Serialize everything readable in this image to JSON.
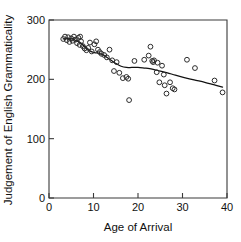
{
  "figure": {
    "width": 241,
    "height": 242,
    "background": "#ffffff",
    "foreground": "#111111"
  },
  "axis_titles": {
    "x": "Age of Arrival",
    "y": "Judgement of English Grammaticality"
  },
  "ticks": {
    "x_labels": [
      "0",
      "10",
      "20",
      "30",
      "40"
    ],
    "y_labels": [
      "0",
      "100",
      "200",
      "300"
    ]
  },
  "chart_data": {
    "type": "scatter",
    "title": "",
    "subtitle": "",
    "xlabel": "Age of Arrival",
    "ylabel": "Judgement of English Grammaticality",
    "xlim": [
      0,
      40
    ],
    "ylim": [
      0,
      300
    ],
    "xticks": [
      0,
      10,
      20,
      30,
      40
    ],
    "yticks": [
      0,
      100,
      200,
      300
    ],
    "grid": false,
    "legend": null,
    "legend_position": "none",
    "marker": {
      "shape": "open-circle",
      "radius_px": 2.4,
      "stroke": "#2b2b2b",
      "fill": "none"
    },
    "annotations": [],
    "series": [
      {
        "name": "Subjects",
        "type": "scatter",
        "points": [
          [
            3.2,
            268
          ],
          [
            3.6,
            272
          ],
          [
            4.0,
            266
          ],
          [
            4.3,
            271
          ],
          [
            4.6,
            263
          ],
          [
            5.0,
            269
          ],
          [
            5.3,
            265
          ],
          [
            5.6,
            272
          ],
          [
            6.0,
            267
          ],
          [
            6.3,
            261
          ],
          [
            6.6,
            270
          ],
          [
            6.9,
            258
          ],
          [
            7.0,
            272
          ],
          [
            7.2,
            264
          ],
          [
            7.6,
            256
          ],
          [
            8.0,
            252
          ],
          [
            8.4,
            249
          ],
          [
            8.8,
            253
          ],
          [
            9.2,
            262
          ],
          [
            9.6,
            247
          ],
          [
            10.2,
            259
          ],
          [
            10.6,
            264
          ],
          [
            11.0,
            250
          ],
          [
            11.4,
            246
          ],
          [
            11.8,
            243
          ],
          [
            12.4,
            241
          ],
          [
            13.0,
            237
          ],
          [
            13.6,
            250
          ],
          [
            14.2,
            232
          ],
          [
            14.6,
            214
          ],
          [
            15.2,
            229
          ],
          [
            15.8,
            211
          ],
          [
            16.6,
            202
          ],
          [
            17.4,
            204
          ],
          [
            17.8,
            201
          ],
          [
            18.0,
            165
          ],
          [
            19.2,
            231
          ],
          [
            21.4,
            233
          ],
          [
            22.4,
            240
          ],
          [
            22.8,
            255
          ],
          [
            23.2,
            231
          ],
          [
            23.4,
            229
          ],
          [
            23.6,
            232
          ],
          [
            24.2,
            212
          ],
          [
            24.4,
            228
          ],
          [
            24.8,
            195
          ],
          [
            25.4,
            223
          ],
          [
            25.8,
            208
          ],
          [
            26.0,
            190
          ],
          [
            26.4,
            176
          ],
          [
            27.2,
            195
          ],
          [
            27.8,
            185
          ],
          [
            28.2,
            183
          ],
          [
            31.0,
            233
          ],
          [
            32.8,
            219
          ],
          [
            37.2,
            198
          ],
          [
            39.0,
            178
          ]
        ]
      },
      {
        "name": "Fitted curve",
        "type": "line",
        "points": [
          [
            3.2,
            268
          ],
          [
            4.2,
            269
          ],
          [
            5.2,
            268
          ],
          [
            6.2,
            265
          ],
          [
            7.2,
            261
          ],
          [
            8.2,
            254
          ],
          [
            9.2,
            248
          ],
          [
            10.2,
            245
          ],
          [
            11.2,
            244
          ],
          [
            12.2,
            241
          ],
          [
            13.2,
            236
          ],
          [
            14.2,
            231
          ],
          [
            15.2,
            226
          ],
          [
            16.2,
            222
          ],
          [
            17.4,
            220
          ],
          [
            18.6,
            220
          ],
          [
            20.0,
            220
          ],
          [
            21.4,
            219
          ],
          [
            22.6,
            218
          ],
          [
            23.8,
            216
          ],
          [
            25.0,
            214
          ],
          [
            26.6,
            211
          ],
          [
            28.4,
            207
          ],
          [
            30.4,
            203
          ],
          [
            32.6,
            199
          ],
          [
            35.0,
            195
          ],
          [
            37.0,
            191
          ],
          [
            39.0,
            187
          ]
        ]
      }
    ]
  }
}
